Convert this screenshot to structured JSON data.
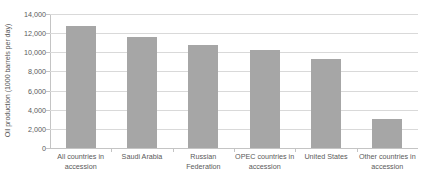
{
  "chart_data": {
    "type": "bar",
    "title": "",
    "xlabel": "",
    "ylabel": "Oil production (1000 barrels per day)",
    "categories": [
      "All countries in accession",
      "Saudi Arabia",
      "Russian Federation",
      "OPEC countries in accession",
      "United States",
      "Other countries in accession"
    ],
    "values": [
      12700,
      11600,
      10800,
      10200,
      9300,
      3000
    ],
    "ylim": [
      0,
      14000
    ],
    "ytick_step": 2000,
    "ytick_labels": [
      "14,000",
      "12,000",
      "10,000",
      "8,000",
      "6,000",
      "4,000",
      "2,000",
      "0"
    ],
    "ytick_values": [
      14000,
      12000,
      10000,
      8000,
      6000,
      4000,
      2000,
      0
    ],
    "grid": true,
    "legend": false,
    "legend_position": "none",
    "series": [
      {
        "name": "Oil production",
        "color": "#a6a6a6",
        "values": [
          12700,
          11600,
          10800,
          10200,
          9300,
          3000
        ]
      }
    ]
  },
  "colors": {
    "bar": "#a6a6a6",
    "gridline": "#d9d9d9",
    "axis": "#c4c4c4",
    "text": "#5a5a5a",
    "background": "#ffffff"
  }
}
